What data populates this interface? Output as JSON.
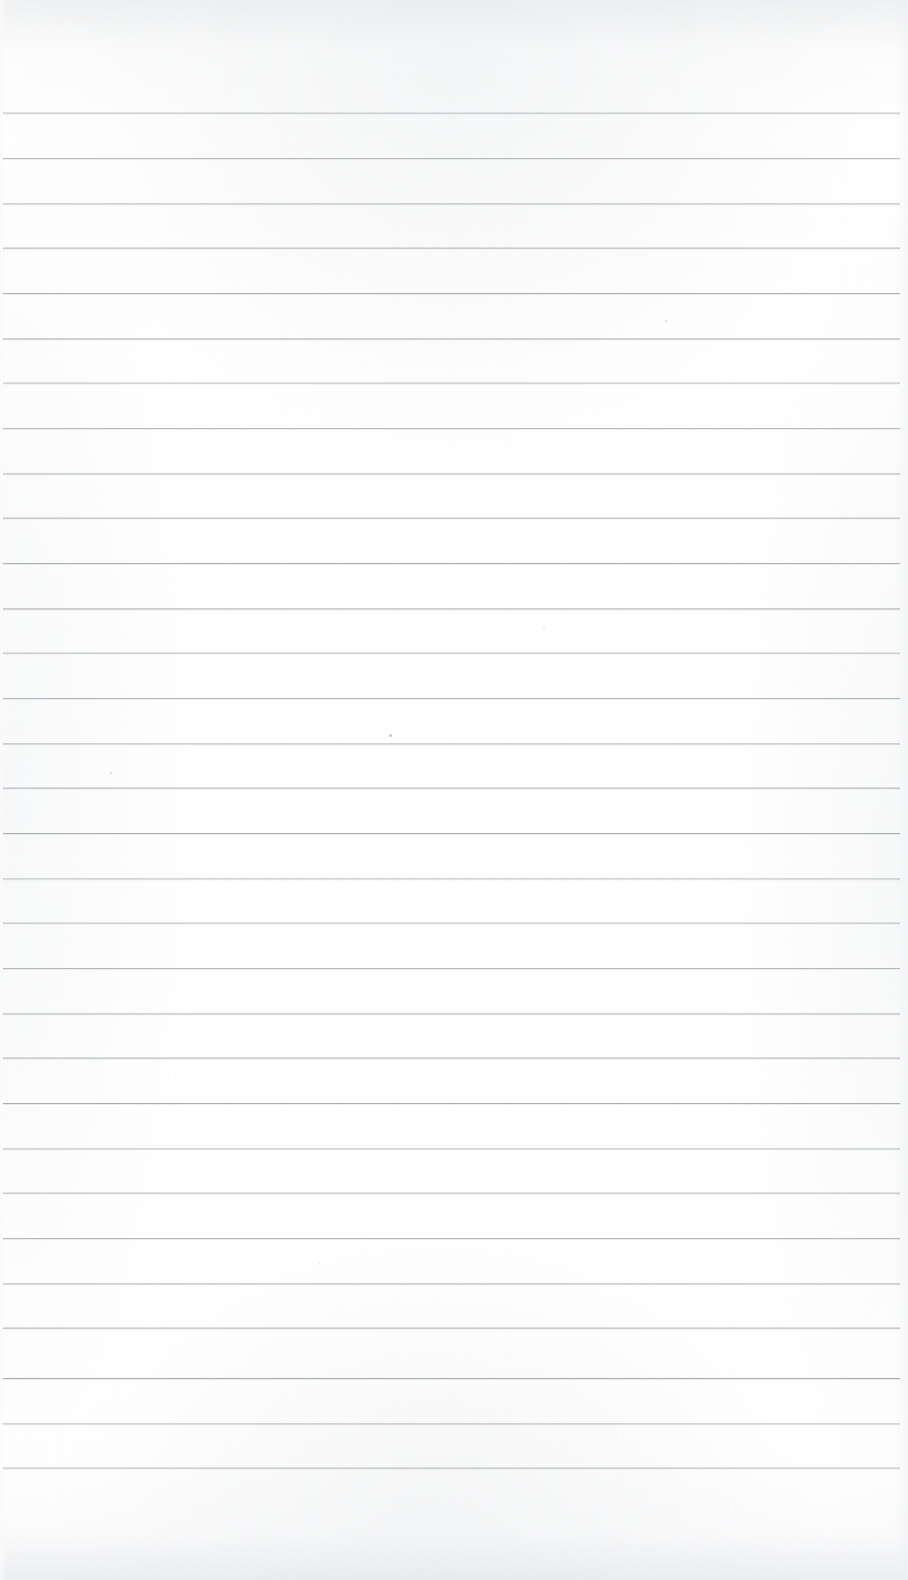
{
  "document": {
    "kind": "scanned-ruled-notepad-page",
    "orientation": "portrait",
    "width_px": 908,
    "height_px": 1580,
    "paper_color": "#ffffff",
    "rule_color": "#a9adb1",
    "content_text": "",
    "has_handwriting": false,
    "has_printed_text": false
  },
  "ruling": {
    "line_count": 31,
    "first_line_y": 113,
    "last_line_y": 1468,
    "line_spacing_px": 45,
    "line_thickness_px": 1,
    "line_left_x": 3,
    "line_right_x": 900,
    "top_margin_px": 113,
    "bottom_margin_px": 112,
    "left_margin_px": 3,
    "right_margin_px": 8,
    "lines_y": [
      113,
      158,
      203,
      248,
      293,
      338,
      383,
      428,
      473,
      518,
      563,
      608,
      653,
      698,
      743,
      788,
      833,
      878,
      923,
      968,
      1013,
      1058,
      1103,
      1148,
      1193,
      1238,
      1283,
      1328,
      1378,
      1423,
      1468
    ]
  },
  "artifacts": {
    "specks": [
      {
        "x": 665,
        "y": 320,
        "size": 2,
        "opacity": 0.3
      },
      {
        "x": 389,
        "y": 734,
        "size": 3,
        "opacity": 0.55
      },
      {
        "x": 110,
        "y": 772,
        "size": 2,
        "opacity": 0.32
      },
      {
        "x": 543,
        "y": 628,
        "size": 2,
        "opacity": 0.22
      },
      {
        "x": 318,
        "y": 1262,
        "size": 2,
        "opacity": 0.2
      },
      {
        "x": 758,
        "y": 455,
        "size": 1,
        "opacity": 0.18
      }
    ]
  }
}
